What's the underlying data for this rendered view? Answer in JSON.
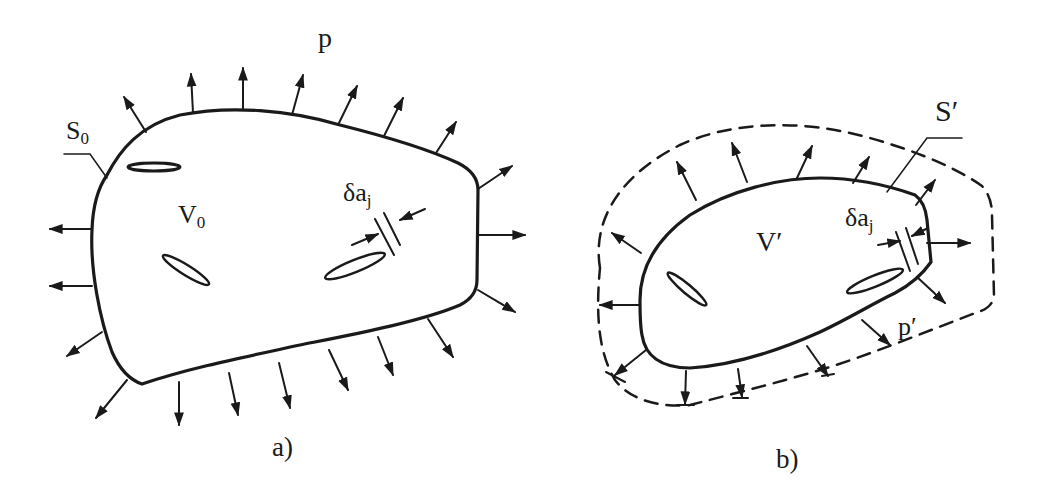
{
  "figure": {
    "panel_a": {
      "caption": "a)",
      "pressure_label": "p",
      "surface_label": {
        "main": "S",
        "sub": "0"
      },
      "volume_label": {
        "main": "V",
        "sub": "0"
      },
      "crack_growth_label": {
        "main": "δa",
        "sub": "j"
      },
      "boundary_style": "solid",
      "arrow_count": 20,
      "crack_count": 3
    },
    "panel_b": {
      "caption": "b)",
      "pressure_label": "p′",
      "surface_label": "S′",
      "volume_label": "V′",
      "crack_growth_label": {
        "main": "δa",
        "sub": "j"
      },
      "boundary_style": "solid inner, dashed outer",
      "arrow_count": 14,
      "crack_count": 2
    },
    "colors": {
      "ink": "#1a1a1a",
      "background": "#ffffff"
    }
  }
}
